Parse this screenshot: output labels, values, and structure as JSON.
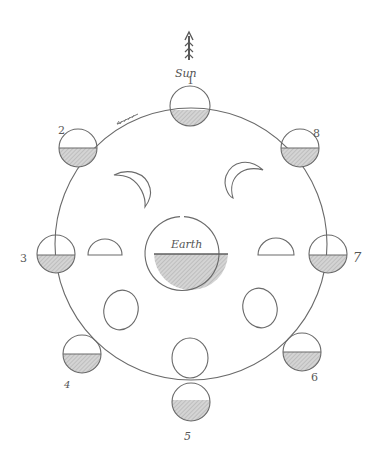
{
  "diagram": {
    "sun_label": "Sun",
    "earth_label": "Earth",
    "orbit_direction_mark": "arrow",
    "colors": {
      "ink": "#6a6a6a",
      "shade": "#bdbdbd",
      "background": "#ffffff"
    },
    "orbit": {
      "cx": 191,
      "cy": 244,
      "r": 136
    },
    "earth": {
      "cx": 191,
      "cy": 253,
      "r": 37
    },
    "orbit_moons": [
      {
        "number": "1",
        "cx": 190,
        "cy": 106,
        "r": 20,
        "label_x": 188,
        "label_y": 84
      },
      {
        "number": "2",
        "cx": 78,
        "cy": 148,
        "r": 19,
        "label_x": 58,
        "label_y": 132
      },
      {
        "number": "8",
        "cx": 300,
        "cy": 148,
        "r": 19,
        "label_x": 313,
        "label_y": 136
      },
      {
        "number": "3",
        "cx": 56,
        "cy": 254,
        "r": 19,
        "label_x": 40,
        "label_y": 258
      },
      {
        "number": "7",
        "cx": 328,
        "cy": 254,
        "r": 19,
        "label_x": 352,
        "label_y": 258
      },
      {
        "number": "4",
        "cx": 82,
        "cy": 354,
        "r": 19,
        "label_x": 68,
        "label_y": 384
      },
      {
        "number": "6",
        "cx": 302,
        "cy": 352,
        "r": 19,
        "label_x": 312,
        "label_y": 380
      },
      {
        "number": "5",
        "cx": 191,
        "cy": 402,
        "r": 19,
        "label_x": 186,
        "label_y": 438
      }
    ],
    "inner_phases": [
      {
        "name": "waxing-crescent",
        "position": "upper-left"
      },
      {
        "name": "waning-crescent",
        "position": "upper-right"
      },
      {
        "name": "first-quarter",
        "position": "left"
      },
      {
        "name": "last-quarter",
        "position": "right"
      },
      {
        "name": "gibbous",
        "position": "lower-left"
      },
      {
        "name": "gibbous",
        "position": "lower-right"
      },
      {
        "name": "full-moon",
        "position": "bottom"
      }
    ]
  }
}
